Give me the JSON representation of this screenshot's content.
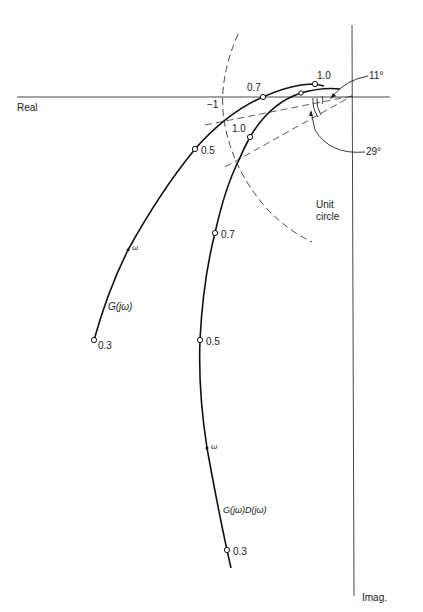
{
  "axes": {
    "real_label": "Real",
    "imag_label": "Imag."
  },
  "critical_point": {
    "label": "−1"
  },
  "unit_circle": {
    "label_line1": "Unit",
    "label_line2": "circle"
  },
  "curves": {
    "g": {
      "label": "G(jω)",
      "omega_label": "ω",
      "points": [
        {
          "label": "0.3"
        },
        {
          "label": "0.5"
        },
        {
          "label": "0.7"
        },
        {
          "label": "1.0"
        }
      ]
    },
    "gd": {
      "label": "G(jω)D(jω)",
      "omega_label": "ω",
      "points": [
        {
          "label": "0.3"
        },
        {
          "label": "0.5"
        },
        {
          "label": "0.7"
        },
        {
          "label": "1.0"
        }
      ]
    }
  },
  "angles": {
    "small": "11°",
    "large": "29°"
  },
  "colors": {
    "ink": "#1a1a1a",
    "background": "#ffffff"
  }
}
